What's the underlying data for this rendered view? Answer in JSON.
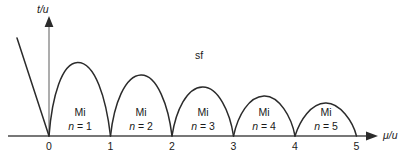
{
  "figure": {
    "background_color": "#ffffff",
    "line_color": "#2b2b2b",
    "axis_color": "#3a3a3a"
  },
  "axes": {
    "y_label": "t/u",
    "x_label": "μ/u",
    "y_axis_name": "t-over-u-axis",
    "x_axis_name": "mu-over-u-axis"
  },
  "ticks": {
    "x": [
      "0",
      "1",
      "2",
      "3",
      "4",
      "5"
    ]
  },
  "regions": {
    "superfluid": {
      "label": "sf"
    },
    "mott": [
      {
        "label": "Mi",
        "n_label": "n = 1"
      },
      {
        "label": "Mi",
        "n_label": "n = 2"
      },
      {
        "label": "Mi",
        "n_label": "n = 3"
      },
      {
        "label": "Mi",
        "n_label": "n = 4"
      },
      {
        "label": "Mi",
        "n_label": "n = 5"
      }
    ]
  },
  "chart_data": {
    "type": "line",
    "title": "",
    "xlabel": "μ/u",
    "ylabel": "t/u",
    "xlim": [
      -0.8,
      5.9
    ],
    "ylim": [
      0,
      1.25
    ],
    "grid": false,
    "legend": null,
    "xticks": [
      0,
      1,
      2,
      3,
      4,
      5
    ],
    "xticklabels": [
      "0",
      "1",
      "2",
      "3",
      "4",
      "5"
    ],
    "yticks": [],
    "yticklabels": [],
    "annotations": [
      {
        "text": "sf",
        "x": 2.37,
        "y": 0.68,
        "name": "superfluid-region-label"
      },
      {
        "text": "Mi",
        "x": 0.5,
        "y": 0.24,
        "name": "mott-lobe-1-label"
      },
      {
        "text": "n = 1",
        "x": 0.5,
        "y": 0.12,
        "name": "mott-lobe-1-filling"
      },
      {
        "text": "Mi",
        "x": 1.5,
        "y": 0.24,
        "name": "mott-lobe-2-label"
      },
      {
        "text": "n = 2",
        "x": 1.5,
        "y": 0.12,
        "name": "mott-lobe-2-filling"
      },
      {
        "text": "Mi",
        "x": 2.5,
        "y": 0.24,
        "name": "mott-lobe-3-label"
      },
      {
        "text": "n = 3",
        "x": 2.5,
        "y": 0.12,
        "name": "mott-lobe-3-filling"
      },
      {
        "text": "Mi",
        "x": 3.5,
        "y": 0.24,
        "name": "mott-lobe-4-label"
      },
      {
        "text": "n = 4",
        "x": 3.5,
        "y": 0.12,
        "name": "mott-lobe-4-filling"
      },
      {
        "text": "Mi",
        "x": 4.5,
        "y": 0.24,
        "name": "mott-lobe-5-label"
      },
      {
        "text": "n = 5",
        "x": 4.5,
        "y": 0.12,
        "name": "mott-lobe-5-filling"
      }
    ],
    "series": [
      {
        "name": "mott-lobe-1",
        "type": "lobe",
        "x_start": 0,
        "x_end": 1,
        "peak_x": 0.46,
        "peak_y": 0.755
      },
      {
        "name": "mott-lobe-2",
        "type": "lobe",
        "x_start": 1,
        "x_end": 2,
        "peak_x": 1.5,
        "peak_y": 0.625
      },
      {
        "name": "mott-lobe-3",
        "type": "lobe",
        "x_start": 2,
        "x_end": 3,
        "peak_x": 2.5,
        "peak_y": 0.5
      },
      {
        "name": "mott-lobe-4",
        "type": "lobe",
        "x_start": 3,
        "x_end": 4,
        "peak_x": 3.5,
        "peak_y": 0.4
      },
      {
        "name": "mott-lobe-5",
        "type": "lobe",
        "x_start": 4,
        "x_end": 5,
        "peak_x": 4.5,
        "peak_y": 0.315
      },
      {
        "name": "left-boundary-line",
        "type": "line",
        "x": [
          -0.52,
          0.0
        ],
        "y": [
          1.0,
          0.0
        ]
      }
    ]
  }
}
